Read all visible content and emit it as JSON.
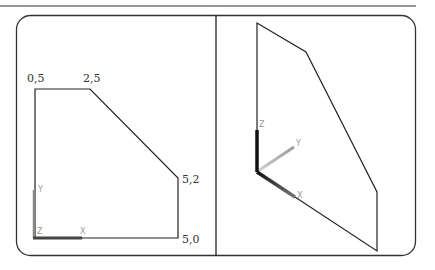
{
  "figure": {
    "colors": {
      "line": "#222222",
      "frame": "#333333",
      "axis_dark": "#222222",
      "axis_light": "#b0b0b0",
      "axis_label": "#9a9a9a"
    },
    "left_view": {
      "title": "2D plan view",
      "vertex_labels": [
        {
          "text": "0,5",
          "x": 27,
          "y": 81
        },
        {
          "text": "2,5",
          "x": 83,
          "y": 81
        },
        {
          "text": "5,2",
          "x": 182,
          "y": 182
        },
        {
          "text": "5,0",
          "x": 182,
          "y": 242
        }
      ],
      "axes": {
        "x_label": "X",
        "y_label": "Y",
        "z_label": "Z"
      }
    },
    "right_view": {
      "title": "3D isometric view",
      "axes": {
        "x_label": "X",
        "y_label": "Y",
        "z_label": "Z"
      }
    }
  }
}
